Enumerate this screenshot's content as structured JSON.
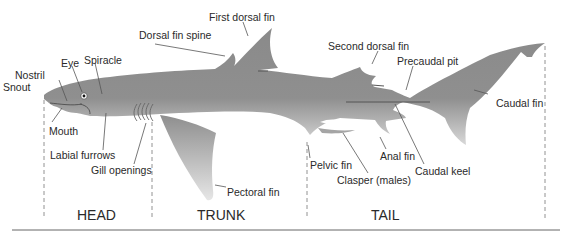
{
  "diagram": {
    "body_color": "#8c8c8c",
    "line_color": "#555555",
    "labels": [
      {
        "id": "snout",
        "text": "Snout",
        "x": 3,
        "y": 81
      },
      {
        "id": "nostril",
        "text": "Nostril",
        "x": 15,
        "y": 69
      },
      {
        "id": "eye",
        "text": "Eye",
        "x": 61,
        "y": 57
      },
      {
        "id": "spiracle",
        "text": "Spiracle",
        "x": 84,
        "y": 54
      },
      {
        "id": "dorsal-fin-spine",
        "text": "Dorsal fin spine",
        "x": 139,
        "y": 29
      },
      {
        "id": "first-dorsal-fin",
        "text": "First dorsal fin",
        "x": 209,
        "y": 11
      },
      {
        "id": "second-dorsal-fin",
        "text": "Second dorsal fin",
        "x": 328,
        "y": 40
      },
      {
        "id": "precaudal-pit",
        "text": "Precaudal pit",
        "x": 397,
        "y": 55
      },
      {
        "id": "caudal-fin",
        "text": "Caudal fin",
        "x": 496,
        "y": 97
      },
      {
        "id": "mouth",
        "text": "Mouth",
        "x": 49,
        "y": 125
      },
      {
        "id": "labial-furrows",
        "text": "Labial furrows",
        "x": 50,
        "y": 149
      },
      {
        "id": "gill-openings",
        "text": "Gill openings",
        "x": 91,
        "y": 164
      },
      {
        "id": "pectoral-fin",
        "text": "Pectoral fin",
        "x": 227,
        "y": 186
      },
      {
        "id": "pelvic-fin",
        "text": "Pelvic fin",
        "x": 310,
        "y": 159
      },
      {
        "id": "clasper",
        "text": "Clasper (males)",
        "x": 337,
        "y": 174
      },
      {
        "id": "anal-fin",
        "text": "Anal fin",
        "x": 380,
        "y": 150
      },
      {
        "id": "caudal-keel",
        "text": "Caudal keel",
        "x": 415,
        "y": 165
      }
    ],
    "regions": [
      {
        "id": "head",
        "text": "HEAD",
        "x": 77,
        "y": 207
      },
      {
        "id": "trunk",
        "text": "TRUNK",
        "x": 197,
        "y": 207
      },
      {
        "id": "tail",
        "text": "TAIL",
        "x": 371,
        "y": 207
      }
    ]
  }
}
